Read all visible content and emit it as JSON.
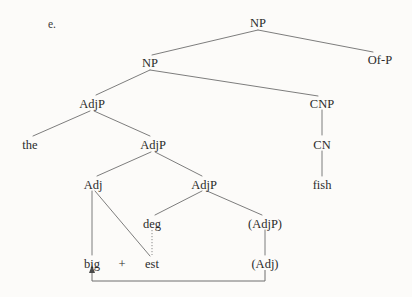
{
  "figure": {
    "item_label": "e.",
    "domain": "syntax-tree",
    "background_color": "#fcfbf9",
    "text_color": "#2b2b2b",
    "line_color": "#6e6e6e"
  },
  "nodes": {
    "np_root": {
      "label": "NP",
      "x": 258,
      "y": 22
    },
    "np_inner": {
      "label": "NP",
      "x": 150,
      "y": 62
    },
    "of_p": {
      "label": "Of-P",
      "x": 380,
      "y": 59
    },
    "adjp_outer": {
      "label": "AdjP",
      "x": 92,
      "y": 103
    },
    "cnp": {
      "label": "CNP",
      "x": 322,
      "y": 103
    },
    "the": {
      "label": "the",
      "x": 30,
      "y": 144
    },
    "adjp_mid": {
      "label": "AdjP",
      "x": 153,
      "y": 144
    },
    "cn": {
      "label": "CN",
      "x": 322,
      "y": 144
    },
    "adj": {
      "label": "Adj",
      "x": 93,
      "y": 184
    },
    "adjp_inner": {
      "label": "AdjP",
      "x": 204,
      "y": 184
    },
    "fish": {
      "label": "fish",
      "x": 322,
      "y": 184
    },
    "deg": {
      "label": "deg",
      "x": 152,
      "y": 223
    },
    "adjp_trace": {
      "label": "(AdjP)",
      "x": 265,
      "y": 223
    },
    "big": {
      "label": "big",
      "x": 92,
      "y": 263
    },
    "plus": {
      "label": "+",
      "x": 122,
      "y": 263
    },
    "est": {
      "label": "est",
      "x": 152,
      "y": 263
    },
    "adj_trace": {
      "label": "(Adj)",
      "x": 265,
      "y": 263
    }
  },
  "edges": [
    {
      "name": "np-root-to-np-inner",
      "from": "np_root",
      "to": "np_inner",
      "style": "solid"
    },
    {
      "name": "np-root-to-of-p",
      "from": "np_root",
      "to": "of_p",
      "style": "solid"
    },
    {
      "name": "np-inner-to-adjp-outer",
      "from": "np_inner",
      "to": "adjp_outer",
      "style": "solid"
    },
    {
      "name": "np-inner-to-cnp",
      "from": "np_inner",
      "to": "cnp",
      "style": "solid"
    },
    {
      "name": "adjp-outer-to-the",
      "from": "adjp_outer",
      "to": "the",
      "style": "solid"
    },
    {
      "name": "adjp-outer-to-adjp-mid",
      "from": "adjp_outer",
      "to": "adjp_mid",
      "style": "solid"
    },
    {
      "name": "cnp-to-cn",
      "from": "cnp",
      "to": "cn",
      "style": "solid"
    },
    {
      "name": "cn-to-fish",
      "from": "cn",
      "to": "fish",
      "style": "solid"
    },
    {
      "name": "adjp-mid-to-adj",
      "from": "adjp_mid",
      "to": "adj",
      "style": "solid"
    },
    {
      "name": "adjp-mid-to-adjp-inner",
      "from": "adjp_mid",
      "to": "adjp_inner",
      "style": "solid"
    },
    {
      "name": "adj-to-big",
      "from": "adj",
      "to": "big",
      "style": "solid"
    },
    {
      "name": "adj-to-est",
      "from": "adj",
      "to": "est",
      "style": "solid"
    },
    {
      "name": "adjp-inner-to-deg",
      "from": "adjp_inner",
      "to": "deg",
      "style": "solid"
    },
    {
      "name": "adjp-inner-to-adjp-trace",
      "from": "adjp_inner",
      "to": "adjp_trace",
      "style": "solid"
    },
    {
      "name": "deg-to-est",
      "from": "deg",
      "to": "est",
      "style": "dotted"
    },
    {
      "name": "adjp-trace-to-adj-trace",
      "from": "adjp_trace",
      "to": "adj_trace",
      "style": "solid"
    }
  ],
  "movement": {
    "name": "adj-trace-to-big-movement",
    "from": "adj_trace",
    "to": "big",
    "path": "M 265 270 L 265 281 L 92 281 L 92 271",
    "arrow_points": "92,266 89,273 95,273"
  }
}
